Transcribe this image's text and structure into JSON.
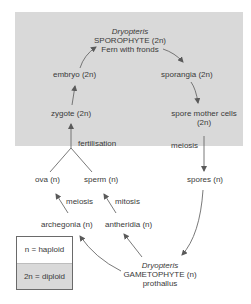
{
  "diagram": {
    "colors": {
      "diploid_shade": "#d9d9d9",
      "haploid_bg": "#ffffff",
      "arrow": "#5a5a5a",
      "text": "#3a3a3a"
    },
    "sporophyte": {
      "genus": "Dryopteris",
      "name": "SPOROPHYTE",
      "ploidy": "(2n)",
      "desc": "Fern with fronds"
    },
    "nodes": {
      "sporangia": {
        "label": "sporangia",
        "ploidy": "(2n)"
      },
      "spore_mother_cells": {
        "label": "spore mother cells",
        "ploidy": "(2n)"
      },
      "spores": {
        "label": "spores",
        "ploidy": "(n)"
      },
      "embryo": {
        "label": "embryo",
        "ploidy": "(2n)"
      },
      "zygote": {
        "label": "zygote",
        "ploidy": "(2n)"
      },
      "ova": {
        "label": "ova",
        "ploidy": "(n)"
      },
      "sperm": {
        "label": "sperm",
        "ploidy": "(n)"
      },
      "archegonia": {
        "label": "archegonia",
        "ploidy": "(n)"
      },
      "antheridia": {
        "label": "antheridia",
        "ploidy": "(n)"
      }
    },
    "gametophyte": {
      "genus": "Dryopteris",
      "name": "GAMETOPHYTE",
      "ploidy": "(n)",
      "desc": "prothallus"
    },
    "processes": {
      "fertilisation": "fertilisation",
      "meiosis_spores": "meiosis",
      "meiosis_ova": "meiosis",
      "mitosis_sperm": "mitosis"
    },
    "legend": {
      "haploid": "n = haploid",
      "diploid": "2n = diploid"
    }
  }
}
